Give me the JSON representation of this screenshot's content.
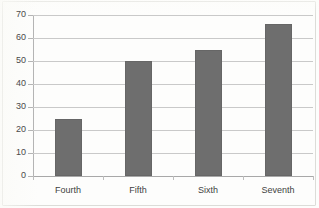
{
  "chart_data": {
    "type": "bar",
    "title": "",
    "subtitle": "",
    "xlabel": "",
    "ylabel": "",
    "categories": [
      "Fourth",
      "Fifth",
      "Sixth",
      "Seventh"
    ],
    "values": [
      25,
      50,
      55,
      66
    ],
    "series": [
      {
        "name": "Series 1",
        "values": [
          25,
          50,
          55,
          66
        ]
      }
    ],
    "ylim": [
      0,
      70
    ],
    "ytick_values": [
      0,
      10,
      20,
      30,
      40,
      50,
      60,
      70
    ],
    "ytick_labels": [
      "0",
      "10",
      "20",
      "30",
      "40",
      "50",
      "60",
      "70"
    ],
    "grid": "horizontal",
    "legend": "none",
    "bar_color": "#6e6e6e",
    "gridline_color": "#c9c9c9",
    "axis_color": "#b4b4b4",
    "background_color": "#fdfdfc"
  }
}
